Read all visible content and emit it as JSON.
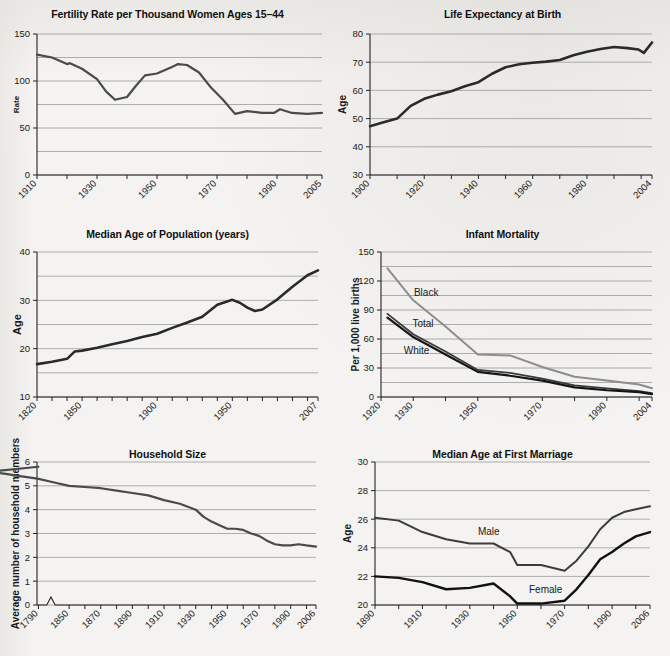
{
  "page": {
    "background_color": "#f4f3f1",
    "line_dark_color": "#3a3a3a",
    "line_black_color": "#151515",
    "line_gray_color": "#8d8d8d",
    "gridline_color": "#9a9a9a",
    "axis_color": "#222222"
  },
  "charts": [
    {
      "id": "fertility-rate",
      "chart_data": {
        "type": "line",
        "title": "Fertility Rate per Thousand Women Ages 15–44",
        "xlabel": "",
        "ylabel": "Rate",
        "xlim": [
          1910,
          2005
        ],
        "ylim": [
          0,
          150
        ],
        "yticks": [
          0,
          25,
          50,
          75,
          100,
          125,
          150
        ],
        "ytick_labels": [
          "0",
          "",
          "50",
          "",
          "100",
          "",
          "150"
        ],
        "xticks": [
          1910,
          1920,
          1930,
          1940,
          1950,
          1960,
          1970,
          1980,
          1990,
          2000,
          2005
        ],
        "xtick_labels": [
          "1910",
          "",
          "1930",
          "",
          "1950",
          "",
          "1970",
          "",
          "1990",
          "",
          "2005"
        ],
        "grid": true,
        "legend": "none",
        "series": [
          {
            "name": "Fertility rate",
            "color": "#4a4a4a",
            "width": 2.2,
            "x": [
              1910,
              1915,
              1920,
              1921,
              1925,
              1930,
              1933,
              1936,
              1940,
              1943,
              1946,
              1950,
              1955,
              1957,
              1960,
              1964,
              1968,
              1972,
              1976,
              1980,
              1985,
              1989,
              1991,
              1995,
              2000,
              2005
            ],
            "y": [
              128,
              125,
              118,
              119,
              113,
              102,
              89,
              80,
              83,
              95,
              106,
              108,
              115,
              118,
              117,
              109,
              93,
              80,
              65,
              68,
              66,
              66,
              70,
              66,
              65,
              66
            ]
          }
        ]
      }
    },
    {
      "id": "life-expectancy",
      "chart_data": {
        "type": "line",
        "title": "Life Expectancy at Birth",
        "xlabel": "",
        "ylabel": "Age",
        "xlim": [
          1900,
          2004
        ],
        "ylim": [
          30,
          80
        ],
        "yticks": [
          30,
          40,
          50,
          60,
          70,
          80
        ],
        "ytick_labels": [
          "30",
          "40",
          "50",
          "60",
          "70",
          "80"
        ],
        "xticks": [
          1900,
          1910,
          1920,
          1930,
          1940,
          1950,
          1960,
          1970,
          1980,
          1990,
          2000,
          2004
        ],
        "xtick_labels": [
          "1900",
          "",
          "1920",
          "",
          "1940",
          "",
          "1960",
          "",
          "1980",
          "",
          "",
          "2004"
        ],
        "grid": true,
        "legend": "none",
        "series": [
          {
            "name": "Life expectancy",
            "color": "#2a2a2a",
            "width": 2.6,
            "x": [
              1900,
              1905,
              1910,
              1915,
              1920,
              1925,
              1930,
              1935,
              1940,
              1945,
              1950,
              1955,
              1960,
              1965,
              1970,
              1975,
              1980,
              1985,
              1990,
              1995,
              1999,
              2001,
              2004
            ],
            "y": [
              47.3,
              48.7,
              50.0,
              54.5,
              57.0,
              58.5,
              59.7,
              61.5,
              62.9,
              65.9,
              68.2,
              69.3,
              69.8,
              70.2,
              70.8,
              72.5,
              73.7,
              74.7,
              75.4,
              75.0,
              74.5,
              73.3,
              77.0
            ]
          }
        ]
      }
    },
    {
      "id": "median-age-population",
      "chart_data": {
        "type": "line",
        "title": "Median Age of Population (years)",
        "xlabel": "",
        "ylabel": "Age",
        "xlim": [
          1820,
          2007
        ],
        "ylim": [
          10,
          40
        ],
        "yticks": [
          10,
          15,
          20,
          25,
          30,
          35,
          40
        ],
        "ytick_labels": [
          "10",
          "",
          "20",
          "",
          "30",
          "",
          "40"
        ],
        "xticks": [
          1820,
          1830,
          1840,
          1850,
          1860,
          1870,
          1880,
          1890,
          1900,
          1910,
          1920,
          1930,
          1940,
          1950,
          1960,
          1970,
          1980,
          1990,
          2000,
          2007
        ],
        "xtick_labels": [
          "1820",
          "",
          "",
          "1850",
          "",
          "",
          "",
          "",
          "1900",
          "",
          "",
          "",
          "",
          "1950",
          "",
          "",
          "",
          "",
          "",
          "2007"
        ],
        "grid": true,
        "legend": "none",
        "series": [
          {
            "name": "Median age",
            "color": "#2a2a2a",
            "width": 2.6,
            "x": [
              1820,
              1830,
              1840,
              1845,
              1850,
              1860,
              1870,
              1880,
              1890,
              1900,
              1910,
              1920,
              1930,
              1940,
              1950,
              1955,
              1960,
              1965,
              1970,
              1980,
              1990,
              2000,
              2007
            ],
            "y": [
              16.8,
              17.3,
              17.9,
              19.4,
              19.6,
              20.2,
              20.9,
              21.6,
              22.4,
              23.1,
              24.3,
              25.4,
              26.6,
              29.1,
              30.1,
              29.5,
              28.5,
              27.8,
              28.1,
              30.2,
              32.8,
              35.2,
              36.2
            ]
          }
        ]
      }
    },
    {
      "id": "infant-mortality",
      "chart_data": {
        "type": "line",
        "title": "Infant Mortality",
        "xlabel": "",
        "ylabel": "Per 1,000 live births",
        "xlim": [
          1920,
          2004
        ],
        "ylim": [
          0,
          150
        ],
        "yticks": [
          0,
          15,
          30,
          45,
          60,
          75,
          90,
          105,
          120,
          135,
          150
        ],
        "ytick_labels": [
          "0",
          "",
          "30",
          "",
          "60",
          "",
          "90",
          "",
          "120",
          "",
          "150"
        ],
        "xticks": [
          1920,
          1930,
          1940,
          1950,
          1960,
          1970,
          1980,
          1990,
          2000,
          2004
        ],
        "xtick_labels": [
          "1920",
          "1930",
          "",
          "1950",
          "",
          "1970",
          "",
          "1990",
          "",
          "2004"
        ],
        "grid": true,
        "legend": "inline-annotations",
        "annotations": [
          {
            "text": "Black",
            "x": 1934,
            "y": 104
          },
          {
            "text": "Total",
            "x": 1933,
            "y": 72
          },
          {
            "text": "White",
            "x": 1931,
            "y": 45
          }
        ],
        "series": [
          {
            "name": "Black",
            "color": "#8d8d8d",
            "width": 2.0,
            "x": [
              1922,
              1930,
              1940,
              1950,
              1960,
              1970,
              1980,
              1990,
              2000,
              2004
            ],
            "y": [
              133,
              100,
              73,
              44,
              43,
              31,
              21,
              17,
              13,
              9
            ]
          },
          {
            "name": "Total",
            "color": "#3a3a3a",
            "width": 1.8,
            "x": [
              1922,
              1930,
              1940,
              1950,
              1960,
              1970,
              1980,
              1990,
              2000,
              2004
            ],
            "y": [
              86,
              65,
              47,
              28,
              25,
              19,
              12,
              9,
              6,
              4
            ]
          },
          {
            "name": "White",
            "color": "#151515",
            "width": 2.2,
            "x": [
              1922,
              1930,
              1940,
              1950,
              1960,
              1970,
              1980,
              1990,
              2000,
              2004
            ],
            "y": [
              82,
              62,
              44,
              26,
              22,
              17,
              10,
              7,
              5,
              3
            ]
          }
        ]
      }
    },
    {
      "id": "household-size",
      "chart_data": {
        "type": "line",
        "title": "Household Size",
        "xlabel": "",
        "ylabel": "Average number of household members",
        "xlim": [
          1790,
          2006
        ],
        "ylim": [
          0,
          6
        ],
        "yticks": [
          0,
          1,
          2,
          3,
          4,
          5,
          6
        ],
        "ytick_labels": [
          "0",
          "1",
          "2",
          "3",
          "4",
          "5",
          "6"
        ],
        "xticks": [
          1790,
          1850,
          1860,
          1870,
          1880,
          1890,
          1900,
          1910,
          1920,
          1930,
          1940,
          1950,
          1960,
          1970,
          1980,
          1990,
          2000,
          2006
        ],
        "xtick_labels": [
          "1790",
          "1850",
          "",
          "1870",
          "",
          "1890",
          "",
          "1910",
          "",
          "1930",
          "",
          "1950",
          "",
          "1970",
          "",
          "1990",
          "",
          "2006"
        ],
        "axis_break": {
          "between": [
            1790,
            1850
          ],
          "style": "zigzag"
        },
        "grid": true,
        "legend": "none",
        "series": [
          {
            "name": "Average household size",
            "color": "#4a4a4a",
            "width": 2.2,
            "x": [
              1790,
              1800,
              1810,
              1820,
              1830,
              1840,
              1850,
              1860,
              1870,
              1880,
              1890,
              1900,
              1910,
              1920,
              1930,
              1935,
              1940,
              1945,
              1950,
              1955,
              1960,
              1965,
              1970,
              1975,
              1980,
              1985,
              1990,
              1995,
              2000,
              2006
            ],
            "y": [
              5.8,
              5.6,
              5.5,
              5.4,
              5.3,
              5.15,
              5.0,
              4.95,
              4.9,
              4.8,
              4.7,
              4.6,
              4.4,
              4.25,
              4.0,
              3.7,
              3.5,
              3.35,
              3.2,
              3.2,
              3.15,
              3.0,
              2.9,
              2.7,
              2.55,
              2.5,
              2.5,
              2.55,
              2.5,
              2.45
            ]
          }
        ]
      }
    },
    {
      "id": "median-age-first-marriage",
      "chart_data": {
        "type": "line",
        "title": "Median Age at First Marriage",
        "xlabel": "",
        "ylabel": "Age",
        "xlim": [
          1890,
          2006
        ],
        "ylim": [
          20,
          30
        ],
        "yticks": [
          20,
          22,
          24,
          26,
          28,
          30
        ],
        "ytick_labels": [
          "20",
          "22",
          "24",
          "26",
          "28",
          "30"
        ],
        "xticks": [
          1890,
          1900,
          1910,
          1920,
          1930,
          1940,
          1950,
          1960,
          1970,
          1980,
          1990,
          2000,
          2006
        ],
        "xtick_labels": [
          "1890",
          "",
          "1910",
          "",
          "1930",
          "",
          "1950",
          "",
          "1970",
          "",
          "1990",
          "",
          "2006"
        ],
        "grid": true,
        "legend": "inline-annotations",
        "annotations": [
          {
            "text": "Male",
            "x": 1938,
            "y": 24.9
          },
          {
            "text": "Female",
            "x": 1962,
            "y": 20.85
          }
        ],
        "series": [
          {
            "name": "Male",
            "color": "#3c3c3c",
            "width": 2.0,
            "x": [
              1890,
              1900,
              1910,
              1920,
              1930,
              1940,
              1947,
              1950,
              1955,
              1960,
              1970,
              1975,
              1980,
              1985,
              1990,
              1995,
              2000,
              2006
            ],
            "y": [
              26.1,
              25.9,
              25.1,
              24.6,
              24.3,
              24.3,
              23.7,
              22.8,
              22.8,
              22.8,
              22.4,
              23.1,
              24.1,
              25.3,
              26.1,
              26.5,
              26.7,
              26.9
            ]
          },
          {
            "name": "Female",
            "color": "#111111",
            "width": 2.4,
            "x": [
              1890,
              1900,
              1910,
              1920,
              1930,
              1940,
              1947,
              1950,
              1955,
              1960,
              1970,
              1975,
              1980,
              1985,
              1990,
              1995,
              2000,
              2006
            ],
            "y": [
              22.0,
              21.9,
              21.6,
              21.1,
              21.2,
              21.5,
              20.6,
              20.1,
              20.1,
              20.1,
              20.3,
              21.1,
              22.1,
              23.2,
              23.7,
              24.3,
              24.8,
              25.1
            ]
          }
        ]
      }
    }
  ]
}
